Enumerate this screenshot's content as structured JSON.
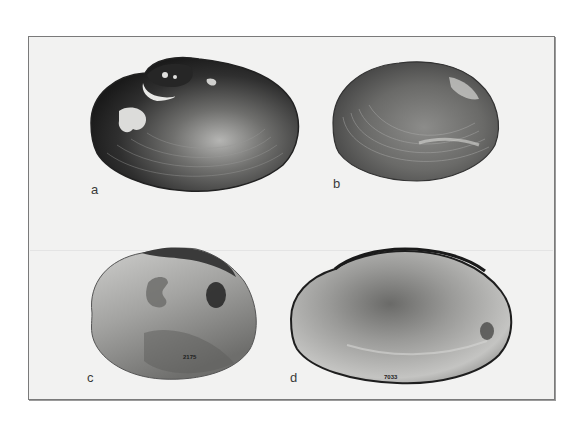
{
  "figure": {
    "panels": [
      {
        "id": "a",
        "label": "a",
        "view": "exterior",
        "tone": "dark"
      },
      {
        "id": "b",
        "label": "b",
        "view": "exterior",
        "tone": "medium"
      },
      {
        "id": "c",
        "label": "c",
        "view": "interior",
        "tone": "light",
        "specimen_number": "2175"
      },
      {
        "id": "d",
        "label": "d",
        "view": "interior",
        "tone": "light",
        "specimen_number": "7033"
      }
    ]
  },
  "colors": {
    "plate_background": "#f2f2f1",
    "plate_border": "#7a7a7a",
    "label_text": "#3a3a3a"
  }
}
